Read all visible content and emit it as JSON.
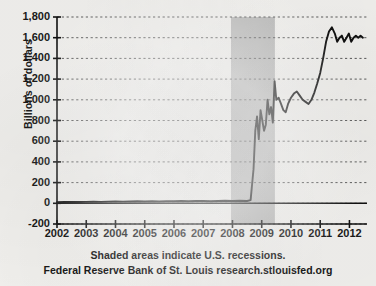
{
  "chart_data": {
    "type": "line",
    "title": "",
    "xlabel": "",
    "ylabel": "Billions of dollars",
    "ylim": [
      -200,
      1800
    ],
    "xlim": [
      2002,
      2012.6
    ],
    "grid": true,
    "legend": null,
    "y_ticks": [
      1800,
      1600,
      1400,
      1200,
      1000,
      800,
      600,
      400,
      200,
      0,
      -200
    ],
    "y_tick_labels": [
      "1,800",
      "1,600",
      "1,400",
      "1,200",
      "1,000",
      "800",
      "600",
      "400",
      "200",
      "0",
      "-200"
    ],
    "x_ticks": [
      2002,
      2003,
      2004,
      2005,
      2006,
      2007,
      2008,
      2009,
      2010,
      2011,
      2012
    ],
    "x_tick_labels": [
      "2002",
      "2003",
      "2004",
      "2005",
      "2006",
      "2007",
      "2008",
      "2009",
      "2010",
      "2011",
      "2012"
    ],
    "shaded_regions": [
      {
        "label": "U.S. recession",
        "x_start": 2007.95,
        "x_end": 2009.45,
        "color": "#b0b0b0"
      }
    ],
    "series": [
      {
        "name": "Reserve balances",
        "color": "#111111",
        "x": [
          2002.0,
          2002.25,
          2002.5,
          2002.75,
          2003.0,
          2003.25,
          2003.5,
          2003.75,
          2004.0,
          2004.25,
          2004.5,
          2004.75,
          2005.0,
          2005.25,
          2005.5,
          2005.75,
          2006.0,
          2006.25,
          2006.5,
          2006.75,
          2007.0,
          2007.25,
          2007.5,
          2007.75,
          2008.0,
          2008.25,
          2008.5,
          2008.62,
          2008.72,
          2008.78,
          2008.84,
          2008.9,
          2008.96,
          2009.02,
          2009.08,
          2009.14,
          2009.2,
          2009.26,
          2009.32,
          2009.38,
          2009.44,
          2009.5,
          2009.58,
          2009.66,
          2009.74,
          2009.82,
          2009.9,
          2010.0,
          2010.1,
          2010.2,
          2010.3,
          2010.4,
          2010.5,
          2010.6,
          2010.7,
          2010.8,
          2010.9,
          2011.0,
          2011.1,
          2011.2,
          2011.3,
          2011.4,
          2011.5,
          2011.58,
          2011.66,
          2011.74,
          2011.82,
          2011.9,
          2011.98,
          2012.06,
          2012.14,
          2012.22,
          2012.3,
          2012.38,
          2012.46
        ],
        "y": [
          10,
          12,
          14,
          12,
          14,
          16,
          14,
          16,
          18,
          16,
          18,
          20,
          18,
          20,
          18,
          20,
          20,
          22,
          20,
          22,
          22,
          20,
          22,
          24,
          22,
          24,
          22,
          30,
          330,
          700,
          840,
          620,
          900,
          800,
          700,
          760,
          1000,
          860,
          930,
          780,
          1180,
          1000,
          1020,
          960,
          900,
          880,
          960,
          1020,
          1060,
          1080,
          1040,
          1000,
          980,
          960,
          1000,
          1070,
          1160,
          1260,
          1400,
          1560,
          1660,
          1700,
          1640,
          1560,
          1600,
          1620,
          1560,
          1600,
          1640,
          1560,
          1600,
          1620,
          1600,
          1620,
          1600
        ]
      }
    ],
    "annotations": [
      "Shaded areas indicate U.S. recessions.",
      "Federal Reserve Bank of St. Louis research.stlouisfed.org"
    ]
  },
  "footer": {
    "recessions_note": "Shaded areas indicate U.S. recessions.",
    "source_note": "Federal Reserve Bank of St. Louis research.stlouisfed.org"
  }
}
